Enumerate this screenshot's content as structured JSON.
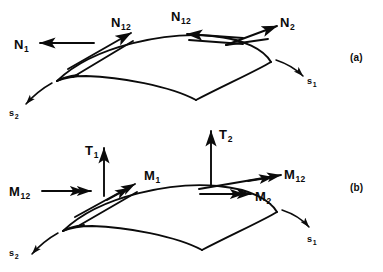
{
  "figure": {
    "background_color": "#ffffff",
    "ink_color": "#0b0b0b",
    "width": 383,
    "height": 272
  },
  "panels": [
    {
      "id": "a",
      "label": "(a)",
      "description": "In-plane (membrane) stress resultants acting on a curved shell element",
      "labels": [
        {
          "name": "N1",
          "base": "N",
          "sub": "1",
          "x": 14,
          "y": 36,
          "arrow": "single",
          "direction": "left"
        },
        {
          "name": "N12L",
          "base": "N",
          "sub": "12",
          "x": 111,
          "y": 14,
          "arrow": "single",
          "direction": "up-right"
        },
        {
          "name": "N12R",
          "base": "N",
          "sub": "12",
          "x": 171,
          "y": 8,
          "arrow": "single",
          "direction": "left"
        },
        {
          "name": "N2",
          "base": "N",
          "sub": "2",
          "x": 280,
          "y": 14,
          "arrow": "single",
          "direction": "up-right"
        },
        {
          "name": "s1",
          "base": "s",
          "sub": "1",
          "x": 307,
          "y": 71,
          "arrow": "tick",
          "direction": "down-right"
        },
        {
          "name": "s2",
          "base": "s",
          "sub": "2",
          "x": 9,
          "y": 103,
          "arrow": "tick",
          "direction": "down-left"
        }
      ]
    },
    {
      "id": "b",
      "label": "(b)",
      "description": "Bending and twisting moment resultants plus transverse shear forces on the shell element",
      "labels": [
        {
          "name": "T1",
          "base": "T",
          "sub": "1",
          "x": 85,
          "y": 142,
          "arrow": "single",
          "direction": "up"
        },
        {
          "name": "T2",
          "base": "T",
          "sub": "2",
          "x": 219,
          "y": 126,
          "arrow": "single",
          "direction": "up"
        },
        {
          "name": "M12L",
          "base": "M",
          "sub": "12",
          "x": 9,
          "y": 183,
          "arrow": "double",
          "direction": "right"
        },
        {
          "name": "M1",
          "base": "M",
          "sub": "1",
          "x": 144,
          "y": 167,
          "arrow": "double",
          "direction": "up-right"
        },
        {
          "name": "M2",
          "base": "M",
          "sub": "2",
          "x": 255,
          "y": 188,
          "arrow": "double",
          "direction": "right"
        },
        {
          "name": "M12R",
          "base": "M",
          "sub": "12",
          "x": 284,
          "y": 166,
          "arrow": "double",
          "direction": "up-right"
        },
        {
          "name": "s1",
          "base": "s",
          "sub": "1",
          "x": 307,
          "y": 229,
          "arrow": "tick",
          "direction": "down-right"
        },
        {
          "name": "s2",
          "base": "s",
          "sub": "2",
          "x": 9,
          "y": 243,
          "arrow": "tick",
          "direction": "down-left"
        }
      ]
    }
  ],
  "panel_label_positions": {
    "a": {
      "x": 350,
      "y": 52
    },
    "b": {
      "x": 350,
      "y": 182
    }
  }
}
